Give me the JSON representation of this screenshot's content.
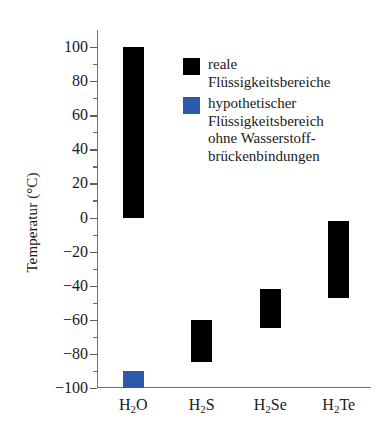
{
  "chart_data": {
    "type": "bar",
    "title": "",
    "subtitle": "",
    "xlabel": "",
    "ylabel": "Temperatur (°C)",
    "categories": [
      "H2O",
      "H2S",
      "H2Se",
      "H2Te"
    ],
    "category_labels_html": [
      "H",
      "2",
      "O",
      "S",
      "Se",
      "Te"
    ],
    "ylim": [
      -100,
      100
    ],
    "ytick_step": 20,
    "yminor_step": 10,
    "grid": false,
    "legend_position": "upper-right-inside",
    "y_tick_labels": [
      "100",
      "80",
      "60",
      "40",
      "20",
      "0",
      "−20",
      "−40",
      "−60",
      "−80",
      "−100"
    ],
    "y_tick_values": [
      100,
      80,
      60,
      40,
      20,
      0,
      -20,
      -40,
      -60,
      -80,
      -100
    ],
    "series": [
      {
        "name": "reale Flüssigkeitsbereiche",
        "color": "#000000",
        "type": "range-bar",
        "ranges": [
          {
            "category": "H2O",
            "low": 0,
            "high": 100
          },
          {
            "category": "H2S",
            "low": -85,
            "high": -60
          },
          {
            "category": "H2Se",
            "low": -65,
            "high": -42
          },
          {
            "category": "H2Te",
            "low": -47,
            "high": -2
          }
        ]
      },
      {
        "name": "hypothetischer Flüssigkeitsbereich ohne Wasserstoffbrückenbindungen",
        "color": "#2d5aa8",
        "type": "range-bar",
        "ranges": [
          {
            "category": "H2O",
            "low": -100,
            "high": -90
          }
        ]
      }
    ]
  },
  "axis": {
    "y_title": "Temperatur (°C)"
  },
  "categories": [
    {
      "base1": "H",
      "sub": "2",
      "base2": "O"
    },
    {
      "base1": "H",
      "sub": "2",
      "base2": "S"
    },
    {
      "base1": "H",
      "sub": "2",
      "base2": "Se"
    },
    {
      "base1": "H",
      "sub": "2",
      "base2": "Te"
    }
  ],
  "ticks": [
    {
      "label": "100"
    },
    {
      "label": "80"
    },
    {
      "label": "60"
    },
    {
      "label": "40"
    },
    {
      "label": "20"
    },
    {
      "label": "0"
    },
    {
      "label": "−20"
    },
    {
      "label": "−40"
    },
    {
      "label": "−60"
    },
    {
      "label": "−80"
    },
    {
      "label": "−100"
    }
  ],
  "legend": {
    "items": [
      {
        "color": "#000000",
        "line1": "reale",
        "line2": "Flüssigkeitsbereiche",
        "line3": "",
        "line4": ""
      },
      {
        "color": "#2d5aa8",
        "line1": "hypothetischer",
        "line2": "Flüssigkeitsbereich",
        "line3": "ohne Wasserstoff-",
        "line4": "brückenbindungen"
      }
    ]
  },
  "colors": {
    "real_range": "#000000",
    "hypothetical_range": "#2d5aa8",
    "axis": "#6f6f6f",
    "text": "#1a1a1a",
    "background": "#ffffff"
  }
}
